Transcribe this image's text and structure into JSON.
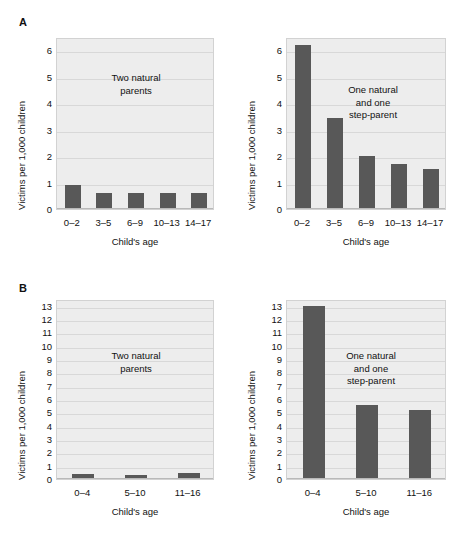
{
  "chart_data": [
    {
      "type": "bar",
      "panel": "A",
      "subplot": "left",
      "title": "Two natural\nparents",
      "xlabel": "Child's age",
      "ylabel": "Victims per 1,000 children",
      "categories": [
        "0–2",
        "3–5",
        "6–9",
        "10–13",
        "14–17"
      ],
      "values": [
        0.9,
        0.62,
        0.62,
        0.6,
        0.62
      ],
      "yticks": [
        0,
        1,
        2,
        3,
        4,
        5,
        6
      ],
      "ylim": [
        0,
        6.5
      ],
      "grid": true,
      "legend": "none",
      "bar_color": "#585858",
      "plot_bg": "#ededed"
    },
    {
      "type": "bar",
      "panel": "A",
      "subplot": "right",
      "title": "One natural\nand one\nstep-parent",
      "xlabel": "Child's age",
      "ylabel": "Victims per 1,000 children",
      "categories": [
        "0–2",
        "3–5",
        "6–9",
        "10–13",
        "14–17"
      ],
      "values": [
        6.2,
        3.45,
        2.0,
        1.7,
        1.5
      ],
      "yticks": [
        0,
        1,
        2,
        3,
        4,
        5,
        6
      ],
      "ylim": [
        0,
        6.5
      ],
      "grid": true,
      "legend": "none",
      "bar_color": "#585858",
      "plot_bg": "#ededed"
    },
    {
      "type": "bar",
      "panel": "B",
      "subplot": "left",
      "title": "Two natural\nparents",
      "xlabel": "Child's age",
      "ylabel": "Victims per 1,000 children",
      "categories": [
        "0–4",
        "5–10",
        "11–16"
      ],
      "values": [
        0.4,
        0.3,
        0.45
      ],
      "yticks": [
        0,
        1,
        2,
        3,
        4,
        5,
        6,
        7,
        8,
        9,
        10,
        11,
        12,
        13
      ],
      "ylim": [
        0,
        13.5
      ],
      "grid": true,
      "legend": "none",
      "bar_color": "#585858",
      "plot_bg": "#ededed"
    },
    {
      "type": "bar",
      "panel": "B",
      "subplot": "right",
      "title": "One natural\nand one\nstep-parent",
      "xlabel": "Child's age",
      "ylabel": "Victims per 1,000 children",
      "categories": [
        "0–4",
        "5–10",
        "11–16"
      ],
      "values": [
        13.0,
        5.55,
        5.2
      ],
      "yticks": [
        0,
        1,
        2,
        3,
        4,
        5,
        6,
        7,
        8,
        9,
        10,
        11,
        12,
        13
      ],
      "ylim": [
        0,
        13.5
      ],
      "grid": true,
      "legend": "none",
      "bar_color": "#585858",
      "plot_bg": "#ededed"
    }
  ],
  "panels": {
    "a": {
      "letter": "A"
    },
    "b": {
      "letter": "B"
    }
  }
}
